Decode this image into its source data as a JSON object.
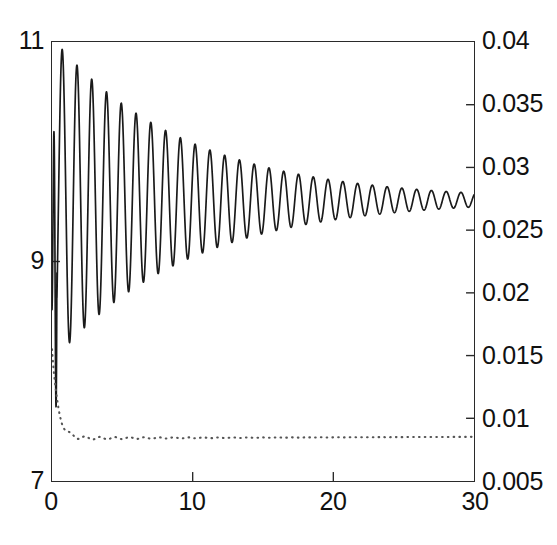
{
  "figure": {
    "background": "#ffffff",
    "frame_color": "#2a2a2a",
    "solid_curve_color": "#1a1a1a",
    "dotted_curve_color": "#555555"
  },
  "annotations": {
    "p_max": {
      "base": "p",
      "sub": "max"
    },
    "h_min": {
      "base": "h",
      "sub": "min"
    },
    "x_axis_label": "T"
  },
  "axes": {
    "left": {
      "label": "p_max",
      "ticks": [
        "11",
        "9",
        "7"
      ],
      "values": [
        11,
        9,
        7
      ],
      "min": 7,
      "max": 11
    },
    "right": {
      "label": "h_min",
      "ticks": [
        "0.04",
        "0.035",
        "0.03",
        "0.025",
        "0.02",
        "0.015",
        "0.01",
        "0.005"
      ],
      "values": [
        0.04,
        0.035,
        0.03,
        0.025,
        0.02,
        0.015,
        0.01,
        0.005
      ],
      "min": 0.005,
      "max": 0.04
    },
    "bottom": {
      "label": "T",
      "ticks": [
        "0",
        "10",
        "20",
        "30"
      ],
      "values": [
        0,
        10,
        20,
        30
      ],
      "min": 0,
      "max": 30
    }
  },
  "chart_data": {
    "type": "line",
    "title": "",
    "xlabel": "T",
    "ylabel": "p_max",
    "ylabel_right": "h_min",
    "xlim": [
      0,
      30
    ],
    "ylim": [
      7,
      11
    ],
    "ylim_right": [
      0.005,
      0.04
    ],
    "grid": false,
    "legend": "none",
    "series": [
      {
        "name": "p_max",
        "axis": "left",
        "style": "solid",
        "color": "#1a1a1a",
        "description": "Damped oscillation: rapid initial transient at T=0 spanning 8.0-10.2, then decaying sinusoid with period ~1.05 settling near 9.55",
        "model": {
          "kind": "damped_oscillation",
          "settle": 9.56,
          "amplitude0": 1.45,
          "decay_rate": 0.105,
          "period": 1.05,
          "phase": -1.5708,
          "transient_end": 0.35
        },
        "key_points": [
          {
            "T": 0.0,
            "p": 9.0
          },
          {
            "T": 0.15,
            "p": 10.25
          },
          {
            "T": 0.25,
            "p": 8.1
          },
          {
            "T": 0.55,
            "p": 10.62
          },
          {
            "T": 1.05,
            "p": 7.62
          },
          {
            "T": 1.6,
            "p": 10.42
          },
          {
            "T": 2.1,
            "p": 7.85
          },
          {
            "T": 2.65,
            "p": 10.22
          },
          {
            "T": 3.15,
            "p": 8.05
          },
          {
            "T": 3.7,
            "p": 10.05
          },
          {
            "T": 4.2,
            "p": 8.25
          },
          {
            "T": 4.75,
            "p": 9.95
          },
          {
            "T": 5.25,
            "p": 8.45
          },
          {
            "T": 5.8,
            "p": 9.88
          },
          {
            "T": 6.3,
            "p": 8.6
          },
          {
            "T": 7.4,
            "p": 9.8
          },
          {
            "T": 8.4,
            "p": 8.82
          },
          {
            "T": 10.5,
            "p": 9.72
          },
          {
            "T": 11.5,
            "p": 9.0
          },
          {
            "T": 14.6,
            "p": 9.66
          },
          {
            "T": 15.6,
            "p": 9.2
          },
          {
            "T": 19.8,
            "p": 9.62
          },
          {
            "T": 20.8,
            "p": 9.36
          },
          {
            "T": 25.0,
            "p": 9.59
          },
          {
            "T": 26.0,
            "p": 9.45
          },
          {
            "T": 30.0,
            "p": 9.56
          }
        ]
      },
      {
        "name": "h_min",
        "axis": "right",
        "style": "dotted",
        "color": "#555555",
        "description": "Steep decay from ~0.0155 at T=0 to ~0.0085 by T=1.2, then nearly flat with tiny ripple around 0.0083 rising slightly to 0.0086 at T=30",
        "model": {
          "kind": "exponential_settle",
          "start": 0.0155,
          "settle": 0.0084,
          "decay_rate": 2.4,
          "ripple_amplitude": 0.00018,
          "ripple_period": 1.05
        },
        "key_points": [
          {
            "T": 0.0,
            "h": 0.0156
          },
          {
            "T": 0.2,
            "h": 0.014
          },
          {
            "T": 0.4,
            "h": 0.0122
          },
          {
            "T": 0.6,
            "h": 0.0107
          },
          {
            "T": 0.8,
            "h": 0.0097
          },
          {
            "T": 1.0,
            "h": 0.009
          },
          {
            "T": 1.3,
            "h": 0.0085
          },
          {
            "T": 1.8,
            "h": 0.0082
          },
          {
            "T": 2.5,
            "h": 0.0084
          },
          {
            "T": 4.0,
            "h": 0.0082
          },
          {
            "T": 6.0,
            "h": 0.0083
          },
          {
            "T": 9.0,
            "h": 0.0083
          },
          {
            "T": 13.0,
            "h": 0.0084
          },
          {
            "T": 18.0,
            "h": 0.0084
          },
          {
            "T": 23.0,
            "h": 0.0085
          },
          {
            "T": 27.0,
            "h": 0.0086
          },
          {
            "T": 30.0,
            "h": 0.0086
          }
        ]
      }
    ]
  }
}
